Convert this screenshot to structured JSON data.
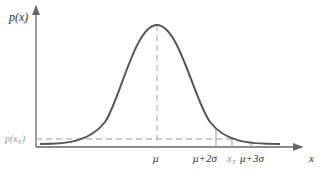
{
  "diagram": {
    "type": "normal-distribution-curve",
    "y_axis_label": "p(x)",
    "x_axis_label": "x",
    "threshold_label": "p(x_T)",
    "threshold_label_main": "p(x",
    "threshold_label_sub": "T",
    "threshold_label_close": ")",
    "x_ticks": [
      {
        "label": "μ"
      },
      {
        "label": "μ+2σ"
      },
      {
        "label_main": "x",
        "label_sub": "T"
      },
      {
        "label": "μ+3σ"
      }
    ],
    "colors": {
      "curve": "#555555",
      "axis": "#666666",
      "dashed": "#999999"
    }
  }
}
